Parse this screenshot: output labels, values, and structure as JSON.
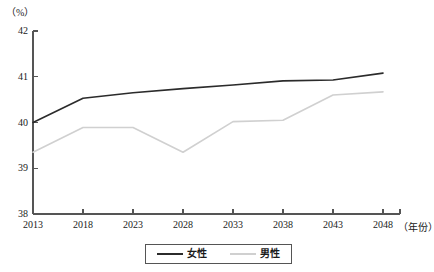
{
  "chart_data": {
    "type": "line",
    "title": "",
    "subtitle": "",
    "xlabel": "（年份）",
    "ylabel": "（%）",
    "x": [
      2013,
      2018,
      2023,
      2028,
      2033,
      2038,
      2043,
      2048
    ],
    "categories": [
      "2013",
      "2018",
      "2023",
      "2028",
      "2033",
      "2038",
      "2043",
      "2048"
    ],
    "series": [
      {
        "name": "女性",
        "color": "#2b2b2b",
        "values": [
          40.0,
          40.53,
          40.65,
          40.74,
          40.82,
          40.91,
          40.93,
          41.08
        ]
      },
      {
        "name": "男性",
        "color": "#d0d0d0",
        "values": [
          39.35,
          39.89,
          39.89,
          39.35,
          40.02,
          40.05,
          40.6,
          40.67
        ]
      }
    ],
    "xlim": [
      2013,
      2048
    ],
    "ylim": [
      38,
      42
    ],
    "yticks": [
      38,
      39,
      40,
      41,
      42
    ],
    "ytick_labels": [
      "38",
      "39",
      "40",
      "41",
      "42"
    ],
    "xticks": [
      2013,
      2018,
      2023,
      2028,
      2033,
      2038,
      2043,
      2048
    ],
    "xtick_labels": [
      "2013",
      "2018",
      "2023",
      "2028",
      "2033",
      "2038",
      "2043",
      "2048"
    ],
    "grid": false,
    "legend_position": "bottom",
    "axis_color": "#555555"
  }
}
